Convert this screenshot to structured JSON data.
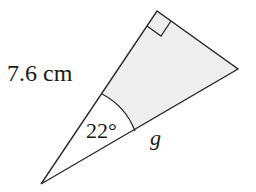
{
  "diagram": {
    "type": "right-triangle",
    "vertices": {
      "apex_bottom": [
        41,
        184
      ],
      "right_angle": [
        157,
        11
      ],
      "right_vertex": [
        238,
        69
      ]
    },
    "labels": {
      "hypotenuse_side": "7.6 cm",
      "angle": "22°",
      "unknown_side": "g"
    },
    "angle_arc_radius": 70,
    "right_angle_marker": true,
    "shaded_region": "triangle minus sector at apex",
    "colors": {
      "stroke": "#2a2a2a",
      "fill_shaded": "#eeeeee",
      "background": "#ffffff",
      "text": "#1a1a1a"
    }
  }
}
